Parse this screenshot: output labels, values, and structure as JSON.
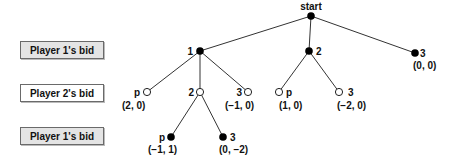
{
  "row_labels": [
    {
      "label": "Player 1's bid",
      "style": "gray"
    },
    {
      "label": "Player 2's bid",
      "style": "white"
    },
    {
      "label": "Player 1's bid",
      "style": "gray"
    }
  ],
  "tree": {
    "root": {
      "label": "start"
    },
    "nodes": [
      {
        "id": "n1",
        "label": "1",
        "player": 1,
        "fill": "black"
      },
      {
        "id": "n2",
        "label": "2",
        "player": 1,
        "fill": "black"
      },
      {
        "id": "n3",
        "label": "3",
        "player": 1,
        "fill": "black",
        "payoff": "(0, 0)"
      },
      {
        "id": "n1p",
        "label": "p",
        "player": 2,
        "fill": "white",
        "payoff": "(2, 0)"
      },
      {
        "id": "n12",
        "label": "2",
        "player": 2,
        "fill": "white"
      },
      {
        "id": "n13",
        "label": "3",
        "player": 2,
        "fill": "white",
        "payoff": "(−1, 0)"
      },
      {
        "id": "n2p",
        "label": "p",
        "player": 2,
        "fill": "white",
        "payoff": "(1, 0)"
      },
      {
        "id": "n23",
        "label": "3",
        "player": 2,
        "fill": "white",
        "payoff": "(−2, 0)"
      },
      {
        "id": "n12p",
        "label": "p",
        "player": 1,
        "fill": "black",
        "payoff": "(−1, 1)"
      },
      {
        "id": "n123",
        "label": "3",
        "player": 1,
        "fill": "black",
        "payoff": "(0, −2)"
      }
    ]
  }
}
